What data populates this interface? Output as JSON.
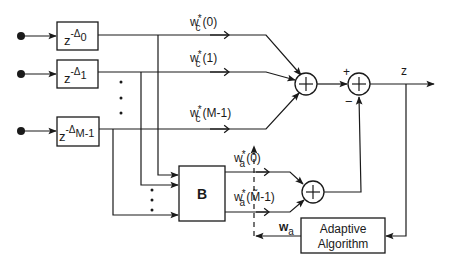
{
  "diagram": {
    "delays": [
      {
        "base": "z",
        "exp_sign": "-",
        "exp": "Δ",
        "sub": "0"
      },
      {
        "base": "z",
        "exp_sign": "-",
        "exp": "Δ",
        "sub": "1"
      },
      {
        "base": "z",
        "exp_sign": "-",
        "exp": "Δ",
        "sub": "M-1"
      }
    ],
    "fixed_weights": [
      {
        "w": "w",
        "sup": "*",
        "sub": "c",
        "arg": "(0)"
      },
      {
        "w": "w",
        "sup": "*",
        "sub": "c",
        "arg": "(1)"
      },
      {
        "w": "w",
        "sup": "*",
        "sub": "c",
        "arg": "(M-1)"
      }
    ],
    "adaptive_weights": [
      {
        "w": "w",
        "sup": "*",
        "sub": "a",
        "arg": "(0)"
      },
      {
        "w": "w",
        "sup": "*",
        "sub": "a",
        "arg": "(M̃-1)"
      }
    ],
    "blocking_matrix_label": "B",
    "adaptive_block": {
      "line1": "Adaptive",
      "line2": "Algorithm"
    },
    "adaptive_weight_vector": {
      "w": "w",
      "sub": "a"
    },
    "sum_symbol": "+",
    "sign_plus": "+",
    "sign_minus": "−",
    "output_label": "z",
    "ellipsis_dot": "•"
  }
}
